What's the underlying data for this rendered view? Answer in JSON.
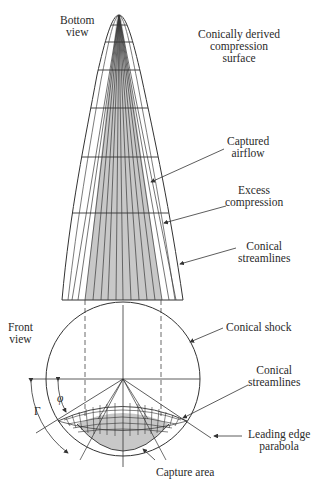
{
  "figure": {
    "bottom_view_label": [
      "Bottom",
      "view"
    ],
    "front_view_label": [
      "Front",
      "view"
    ],
    "annotations": {
      "compression_surface": [
        "Conically derived",
        "compression",
        "surface"
      ],
      "captured_airflow": [
        "Captured",
        "airflow"
      ],
      "excess_compression": [
        "Excess",
        "compression"
      ],
      "conical_streamlines_top": [
        "Conical",
        "streamlines"
      ],
      "conical_shock": [
        "Conical shock"
      ],
      "conical_streamlines_front": [
        "Conical",
        "streamlines"
      ],
      "leading_edge_parabola": [
        "Leading edge",
        "parabola"
      ],
      "capture_area": [
        "Capture area"
      ]
    },
    "angle_symbols": {
      "phi": "φ",
      "gamma": "Γ"
    },
    "colors": {
      "line": "#333333",
      "shaded": "#c8c8c8",
      "background": "#ffffff"
    }
  }
}
